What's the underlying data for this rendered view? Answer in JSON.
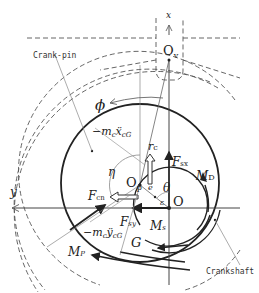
{
  "diagram": {
    "labels": {
      "x_axis": "x",
      "y_axis": "y",
      "Ov": "O",
      "Ov_sub": "v",
      "Op": "O",
      "Op_sub": "p",
      "O": "O",
      "G": "G",
      "phi": "ϕ",
      "eta": "η",
      "theta": "θ",
      "e": "e",
      "epsilon": "ε",
      "rc": "r",
      "rc_sub": "c",
      "crank_pin": "Crank-pin",
      "crankshaft": "Crankshaft",
      "inertia_x": "−m",
      "inertia_x_sub": "c",
      "inertia_x_acc": "ẍ",
      "inertia_x_acc_sub": "cG",
      "inertia_y": "−m",
      "inertia_y_sub": "c",
      "inertia_y_acc": "ÿ",
      "inertia_y_acc_sub": "cG",
      "F_cn": "F",
      "F_cn_sub": "cn",
      "F_sx": "F",
      "F_sx_sub": "sx",
      "F_sy": "F",
      "F_sy_sub": "sy",
      "M_D": "M",
      "M_D_sub": "D",
      "M_s": "M",
      "M_s_sub": "s",
      "M_p": "M",
      "M_p_sub": "P"
    },
    "colors": {
      "line": "#222222",
      "thin": "#666666",
      "dashed": "#555555"
    }
  }
}
